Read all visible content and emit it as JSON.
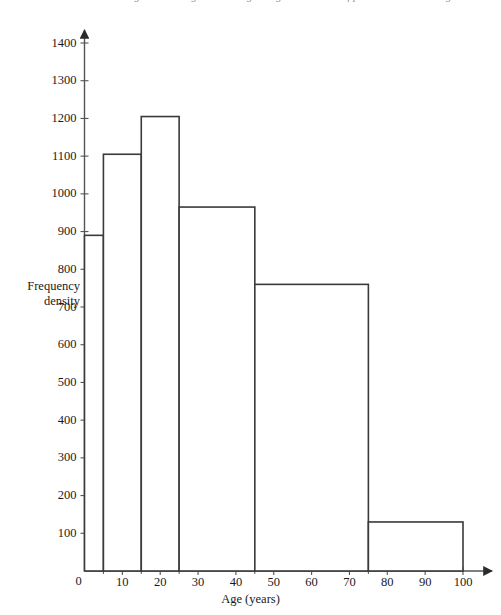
{
  "caption": {
    "text": "Figure 1: Histogram showing the age distribution of patients on current register"
  },
  "chart_data": {
    "type": "bar",
    "title": "",
    "subtitle": "",
    "xlabel": "Age (years)",
    "ylabel_line1": "Frequency",
    "ylabel_line2": "density",
    "xlim": [
      0,
      100
    ],
    "ylim": [
      0,
      1400
    ],
    "grid": false,
    "legend": "none",
    "series_color": "#3a3a3a",
    "bar_fill": "#ffffff",
    "axis_color": "#555555",
    "bin_edges": [
      5,
      15,
      25,
      45,
      75,
      100
    ],
    "bins": [
      {
        "start": 0,
        "end": 5,
        "value": 890,
        "width": 5
      },
      {
        "start": 5,
        "end": 15,
        "value": 1105,
        "width": 10
      },
      {
        "start": 15,
        "end": 25,
        "value": 1205,
        "width": 10
      },
      {
        "start": 25,
        "end": 45,
        "value": 965,
        "width": 20
      },
      {
        "start": 45,
        "end": 75,
        "value": 760,
        "width": 30
      },
      {
        "start": 75,
        "end": 100,
        "value": 130,
        "width": 25
      }
    ],
    "categories": [
      "0-5",
      "5-15",
      "15-25",
      "25-45",
      "45-75",
      "75-100"
    ],
    "values": [
      890,
      1105,
      1205,
      965,
      760,
      130
    ],
    "yticks": [
      0,
      100,
      200,
      300,
      400,
      500,
      600,
      700,
      800,
      900,
      1000,
      1100,
      1200,
      1300,
      1400
    ],
    "ytick_labels": [
      "0",
      "100",
      "200",
      "300",
      "400",
      "500",
      "600",
      "700",
      "800",
      "900",
      "1000",
      "1100",
      "1200",
      "1300",
      "1400"
    ],
    "xticks": [
      0,
      10,
      20,
      30,
      40,
      50,
      60,
      70,
      80,
      90,
      100
    ],
    "xtick_labels": [
      "0",
      "10",
      "20",
      "30",
      "40",
      "50",
      "60",
      "70",
      "80",
      "90",
      "100"
    ],
    "x_minor_ticks": [
      5,
      15,
      25,
      45,
      75
    ]
  }
}
